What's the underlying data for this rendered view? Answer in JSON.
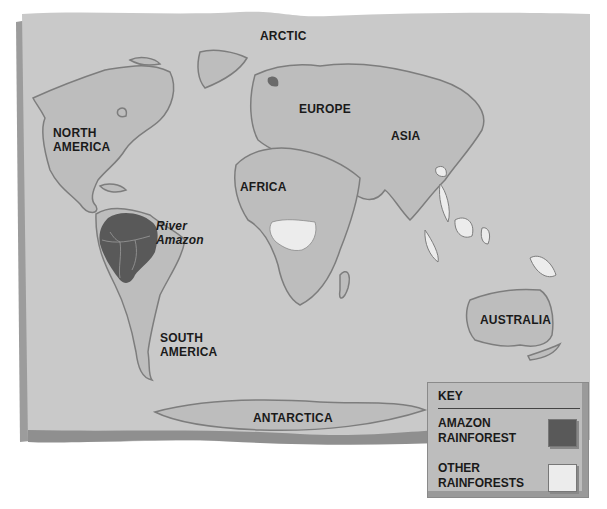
{
  "map": {
    "type": "world rainforest map",
    "colors": {
      "paper": "#c9c9c9",
      "paper_edge": "#a8a8a8",
      "land": "#bdbdbd",
      "coast_shadow": "#7d7d7d",
      "amazon_rainforest": "#595959",
      "other_rainforests": "#ececec"
    },
    "labels": {
      "arctic": "ARCTIC",
      "north_america": "NORTH\nAMERICA",
      "europe": "EUROPE",
      "asia": "ASIA",
      "africa": "AFRICA",
      "river_amazon": "River\nAmazon",
      "south_america": "SOUTH\nAMERICA",
      "australia": "AUSTRALIA",
      "antarctica": "ANTARCTICA"
    }
  },
  "key": {
    "title": "KEY",
    "items": [
      {
        "label": "AMAZON\nRAINFOREST",
        "color": "#595959"
      },
      {
        "label": "OTHER\nRAINFORESTS",
        "color": "#ececec"
      }
    ]
  }
}
